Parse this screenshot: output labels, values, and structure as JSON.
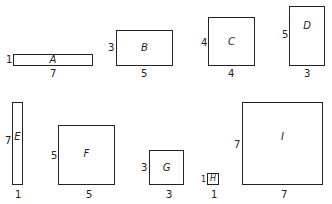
{
  "figure": {
    "rectangles": [
      {
        "name": "A",
        "height": "1",
        "width": "7"
      },
      {
        "name": "B",
        "height": "3",
        "width": "5"
      },
      {
        "name": "C",
        "height": "4",
        "width": "4"
      },
      {
        "name": "D",
        "height": "5",
        "width": "3"
      },
      {
        "name": "E",
        "height": "7",
        "width": "1"
      },
      {
        "name": "F",
        "height": "5",
        "width": "5"
      },
      {
        "name": "G",
        "height": "3",
        "width": "3"
      },
      {
        "name": "H",
        "height": "1",
        "width": "1"
      },
      {
        "name": "I",
        "height": "7",
        "width": "7"
      }
    ]
  }
}
